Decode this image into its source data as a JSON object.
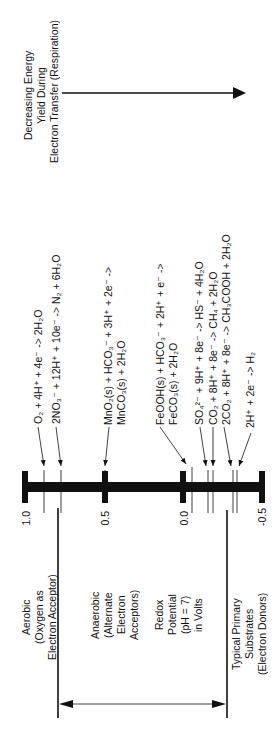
{
  "energy_arrow": {
    "lines": [
      "Decreasing Energy",
      "Yield During",
      "Electron Transfer (Respiration)"
    ]
  },
  "axis": {
    "title_lines": [
      "Redox",
      "Potential",
      "(pH = 7)",
      "in Volts"
    ],
    "ticks": [
      "1.0",
      "0.5",
      "0.0",
      "-0.5"
    ]
  },
  "regions": {
    "aerobic": [
      "Aerobic",
      "(Oxygen as",
      "Electron Acceptor)"
    ],
    "anaerobic": [
      "Anaerobic",
      "(Alternate",
      "Electron",
      "Acceptors)"
    ],
    "donors": [
      "Typical Primary",
      "Substrates",
      "(Electron Donors)"
    ]
  },
  "reactions": [
    {
      "id": "oxygen",
      "line1": "O₂ + 4H⁺ + 4e⁻  ->  2H₂O",
      "line2": "",
      "potential": 0.82
    },
    {
      "id": "nitrate",
      "line1": "2NO₃⁻ + 12H⁺ + 10e⁻  ->  N₂ + 6H₂O",
      "line2": "",
      "potential": 0.74
    },
    {
      "id": "manganese",
      "line1": "MnO₂(s) + HCO₃⁻ + 3H⁺ + 2e⁻  ->",
      "line2": "MnCO₃(s) + 2H₂O",
      "potential": 0.52
    },
    {
      "id": "iron",
      "line1": "FeOOH(s) + HCO₃⁻ + 2H⁺ + e⁻  ->",
      "line2": "FeCO₃(s) + 2H₂O",
      "potential": -0.05
    },
    {
      "id": "sulfate",
      "line1": "SO₄²⁻ + 9H⁺ + 8e⁻  ->  HS⁻ + 4H₂O",
      "line2": "",
      "potential": -0.22
    },
    {
      "id": "methane",
      "line1": "CO₂ + 8H⁺ + 8e⁻  ->  CH₄ + 2H₂O",
      "line2": "",
      "potential": -0.25
    },
    {
      "id": "acetate",
      "line1": "2CO₂ + 8H⁺ + 8e⁻  ->  CH₃COOH + 2H₂O",
      "line2": "",
      "potential": -0.29
    },
    {
      "id": "hydrogen",
      "line1": "2H⁺ + 2e⁻  ->  H₂",
      "line2": "",
      "potential": -0.41
    }
  ],
  "colors": {
    "ink": "#111111",
    "background": "#ffffff"
  }
}
